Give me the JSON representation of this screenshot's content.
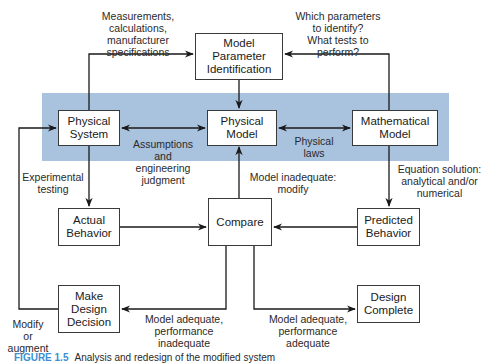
{
  "diagram": {
    "colors": {
      "band": "#a9c3df",
      "line": "#1a1a1a",
      "caption_accent": "#3d8fd1"
    },
    "boxes": {
      "model_parameter_identification": "Model\nParameter\nIdentification",
      "physical_system": "Physical\nSystem",
      "physical_model": "Physical\nModel",
      "mathematical_model": "Mathematical\nModel",
      "actual_behavior": "Actual\nBehavior",
      "compare": "Compare",
      "predicted_behavior": "Predicted\nBehavior",
      "make_design_decision": "Make\nDesign\nDecision",
      "design_complete": "Design\nComplete"
    },
    "labels": {
      "measurements": "Measurements,\ncalculations,\nmanufacturer\nspecifications",
      "which_parameters": "Which parameters\nto identify?\nWhat tests to\nperform?",
      "assumptions": "Assumptions\nand\nengineering\njudgment",
      "physical_laws": "Physical\nlaws",
      "experimental_testing": "Experimental\ntesting",
      "model_inadequate": "Model inadequate:\nmodify",
      "equation_solution": "Equation solution:\nanalytical and/or\nnumerical",
      "modify_or_augment": "Modify\nor\naugment",
      "adequate_performance_inadequate": "Model adequate,\nperformance\ninadequate",
      "adequate_performance_adequate": "Model adequate,\nperformance\nadequate"
    },
    "caption": {
      "figure": "FIGURE 1.5",
      "text": "Analysis and redesign of the modified system"
    }
  }
}
